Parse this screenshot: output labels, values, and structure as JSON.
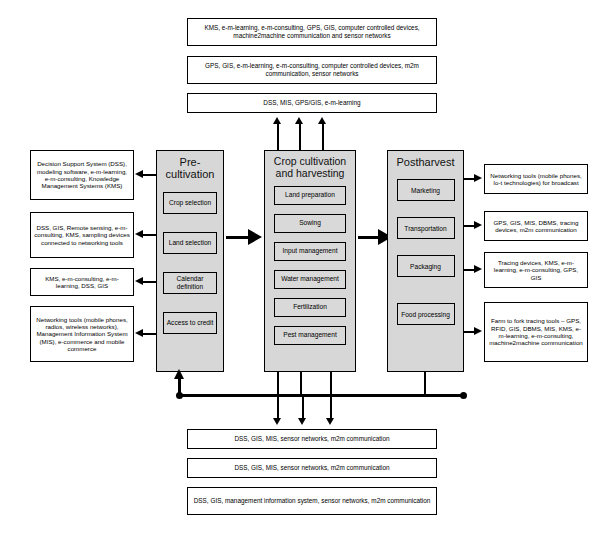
{
  "diagram": {
    "top_banners": [
      "KMS, e-m-learning, e-m-consulting, GPS, GIS, computer controlled devices, machine2machine communication and sensor networks",
      "GPS, GIS, e-m-learning, e-m-consulting, computer controlled devices, m2m communication, sensor networks",
      "DSS, MIS, GPS/GIS, e-m-learning"
    ],
    "left_boxes": [
      "Decision Support System (DSS), modeling software, e-m-learning, e-m-consulting, Knowledge Management Systems (KMS)",
      "DSS, GIS, Remote sensing, e-m-consulting, KMS, sampling devices connected to networking tools",
      "KMS, e-m-consulting, e-m-learning, DSS, GIS",
      "Networking tools (mobile phones, radios, wireless networks), Management Information System (MIS), e-commerce and mobile commerce"
    ],
    "right_boxes": [
      "Networking tools (mobile phones, Io-t technologies) for broadcast",
      "GPS, GIS, MIS, DBMS, tracing devices, m2m communication",
      "Tracing devices, KMS, e-m-learning, e-m-consulting, GPS, GIS",
      "Farm to fork tracing tools – GPS, RFID, GIS, DBMS, MIS, KMS, e-m-learning, e-m-consulting, machine2machine communication"
    ],
    "bottom_banners": [
      "DSS, GIS, MIS, sensor networks, m2m communication",
      "DSS, GIS, MIS, sensor networks, m2m communication",
      "DSS, GIS, management information system, sensor networks, m2m communication"
    ],
    "phases": [
      {
        "title": "Pre-cultivation",
        "tasks": [
          "Crop selection",
          "Land selection",
          "Calendar definition",
          "Access to credit"
        ]
      },
      {
        "title": "Crop cultivation and harvesting",
        "tasks": [
          "Land preparation",
          "Sowing",
          "Input management",
          "Water management",
          "Fertilization",
          "Pest management"
        ]
      },
      {
        "title": "Postharvest",
        "tasks": [
          "Marketing",
          "Transportation",
          "Packaging",
          "Food processing"
        ]
      }
    ],
    "colors": {
      "phase_fill": "#d7d7d7",
      "task_fill": "#d9d9d9",
      "stroke": "#000000",
      "background": "#ffffff"
    }
  }
}
